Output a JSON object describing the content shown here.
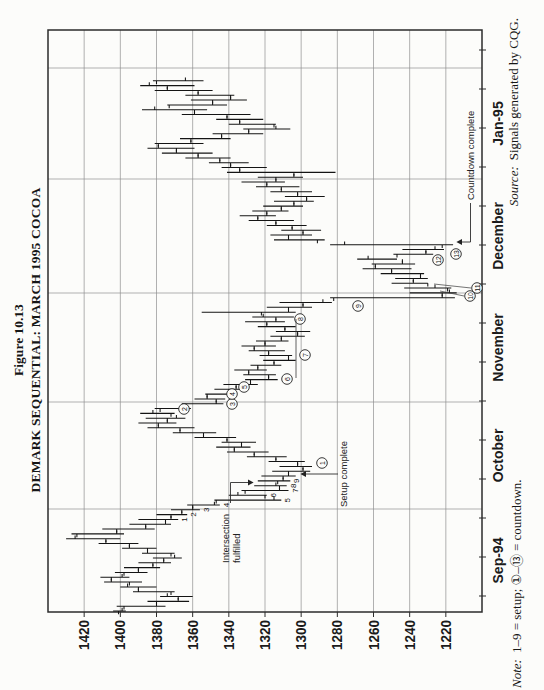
{
  "figure": {
    "label": "Figure 10.13",
    "title": "DEMARK SEQUENTIAL: MARCH 1995 COCOA"
  },
  "note": {
    "prefix": "Note:",
    "body": "1–9 = setup; ①–⑬ = countdown."
  },
  "source": {
    "prefix": "Source:",
    "body": "Signals generated by CQG."
  },
  "annotations": {
    "intersection_line1": "Intersection",
    "intersection_line2": "fulfilled",
    "setup_complete": "Setup complete",
    "countdown_complete": "Countdown complete"
  },
  "chart_data": {
    "type": "ohlc-bar",
    "title": "DEMARK SEQUENTIAL: MARCH 1995 COCOA",
    "ylabel": "price",
    "xlabel": "date",
    "grid": true,
    "y_axis": {
      "min": 1200,
      "max": 1440,
      "grid_step": 20,
      "labels": [
        "1420",
        "1400",
        "1380",
        "1360",
        "1340",
        "1320",
        "1300",
        "1280",
        "1260",
        "1240",
        "1220"
      ]
    },
    "x_axis": {
      "months": [
        "Sep-94",
        "October",
        "November",
        "December",
        "Jan-95"
      ]
    },
    "bars_format": [
      "high",
      "low",
      "open",
      "close"
    ],
    "bars": [
      [
        1404,
        1397,
        1401,
        1399
      ],
      [
        1402,
        1375,
        1398,
        1380
      ],
      [
        1385,
        1362,
        1380,
        1368
      ],
      [
        1378,
        1360,
        1368,
        1374
      ],
      [
        1393,
        1370,
        1372,
        1390
      ],
      [
        1400,
        1380,
        1390,
        1396
      ],
      [
        1409,
        1388,
        1395,
        1405
      ],
      [
        1411,
        1395,
        1405,
        1399
      ],
      [
        1403,
        1385,
        1398,
        1390
      ],
      [
        1398,
        1378,
        1390,
        1382
      ],
      [
        1390,
        1372,
        1382,
        1376
      ],
      [
        1382,
        1366,
        1376,
        1370
      ],
      [
        1388,
        1370,
        1372,
        1385
      ],
      [
        1399,
        1380,
        1385,
        1395
      ],
      [
        1412,
        1390,
        1395,
        1408
      ],
      [
        1430,
        1400,
        1408,
        1425
      ],
      [
        1427,
        1398,
        1424,
        1402
      ],
      [
        1410,
        1381,
        1402,
        1386
      ],
      [
        1395,
        1372,
        1386,
        1375
      ],
      [
        1390,
        1368,
        1375,
        1372
      ],
      [
        1380,
        1363,
        1372,
        1366
      ],
      [
        1372,
        1356,
        1366,
        1360
      ],
      [
        1363,
        1345,
        1360,
        1348
      ],
      [
        1348,
        1311,
        1347,
        1315
      ],
      [
        1340,
        1319,
        1320,
        1335
      ],
      [
        1333,
        1307,
        1331,
        1312
      ],
      [
        1326,
        1308,
        1312,
        1314
      ],
      [
        1324,
        1306,
        1313,
        1310
      ],
      [
        1322,
        1303,
        1310,
        1307
      ],
      [
        1316,
        1295,
        1307,
        1299
      ],
      [
        1312,
        1294,
        1299,
        1302
      ],
      [
        1318,
        1298,
        1302,
        1314
      ],
      [
        1330,
        1308,
        1314,
        1326
      ],
      [
        1341,
        1318,
        1326,
        1337
      ],
      [
        1347,
        1328,
        1337,
        1333
      ],
      [
        1344,
        1325,
        1333,
        1341
      ],
      [
        1359,
        1336,
        1341,
        1354
      ],
      [
        1371,
        1347,
        1354,
        1367
      ],
      [
        1385,
        1359,
        1367,
        1379
      ],
      [
        1390,
        1369,
        1379,
        1374
      ],
      [
        1386,
        1364,
        1374,
        1369
      ],
      [
        1389,
        1370,
        1372,
        1382
      ],
      [
        1381,
        1361,
        1378,
        1364
      ],
      [
        1366,
        1343,
        1364,
        1347
      ],
      [
        1359,
        1342,
        1347,
        1352
      ],
      [
        1353,
        1336,
        1352,
        1340
      ],
      [
        1348,
        1330,
        1340,
        1336
      ],
      [
        1343,
        1324,
        1336,
        1328
      ],
      [
        1331,
        1313,
        1328,
        1318
      ],
      [
        1332,
        1314,
        1318,
        1329
      ],
      [
        1337,
        1319,
        1329,
        1324
      ],
      [
        1328,
        1311,
        1324,
        1315
      ],
      [
        1321,
        1303,
        1315,
        1307
      ],
      [
        1323,
        1305,
        1307,
        1318
      ],
      [
        1329,
        1309,
        1318,
        1326
      ],
      [
        1333,
        1314,
        1326,
        1320
      ],
      [
        1325,
        1307,
        1320,
        1311
      ],
      [
        1317,
        1298,
        1311,
        1302
      ],
      [
        1314,
        1295,
        1302,
        1309
      ],
      [
        1324,
        1303,
        1309,
        1319
      ],
      [
        1331,
        1309,
        1319,
        1314
      ],
      [
        1327,
        1304,
        1314,
        1321
      ],
      [
        1355,
        1303,
        1322,
        1307
      ],
      [
        1319,
        1294,
        1307,
        1299
      ],
      [
        1312,
        1283,
        1299,
        1288
      ],
      [
        1284,
        1215,
        1282,
        1222
      ],
      [
        1240,
        1214,
        1222,
        1218
      ],
      [
        1243,
        1217,
        1219,
        1226
      ],
      [
        1250,
        1230,
        1230,
        1238
      ],
      [
        1248,
        1230,
        1238,
        1234
      ],
      [
        1256,
        1232,
        1234,
        1250
      ],
      [
        1266,
        1239,
        1250,
        1259
      ],
      [
        1261,
        1237,
        1259,
        1244
      ],
      [
        1269,
        1247,
        1244,
        1263
      ],
      [
        1249,
        1227,
        1247,
        1231
      ],
      [
        1244,
        1221,
        1231,
        1226
      ],
      [
        1284,
        1216,
        1222,
        1276
      ],
      [
        1315,
        1287,
        1291,
        1307
      ],
      [
        1317,
        1294,
        1307,
        1299
      ],
      [
        1311,
        1289,
        1299,
        1305
      ],
      [
        1319,
        1297,
        1305,
        1314
      ],
      [
        1329,
        1304,
        1314,
        1324
      ],
      [
        1334,
        1314,
        1324,
        1319
      ],
      [
        1327,
        1307,
        1319,
        1311
      ],
      [
        1321,
        1299,
        1311,
        1304
      ],
      [
        1315,
        1293,
        1304,
        1297
      ],
      [
        1309,
        1287,
        1297,
        1302
      ],
      [
        1317,
        1294,
        1302,
        1311
      ],
      [
        1325,
        1301,
        1311,
        1319
      ],
      [
        1333,
        1309,
        1319,
        1314
      ],
      [
        1324,
        1299,
        1314,
        1304
      ],
      [
        1341,
        1281,
        1304,
        1334
      ],
      [
        1344,
        1319,
        1334,
        1339
      ],
      [
        1351,
        1329,
        1339,
        1345
      ],
      [
        1364,
        1339,
        1345,
        1357
      ],
      [
        1377,
        1349,
        1357,
        1369
      ],
      [
        1385,
        1359,
        1369,
        1379
      ],
      [
        1381,
        1354,
        1379,
        1361
      ],
      [
        1367,
        1339,
        1361,
        1344
      ],
      [
        1349,
        1321,
        1344,
        1329
      ],
      [
        1332,
        1306,
        1329,
        1314
      ],
      [
        1340,
        1314,
        1315,
        1334
      ],
      [
        1347,
        1321,
        1334,
        1341
      ],
      [
        1366,
        1328,
        1341,
        1359
      ],
      [
        1388,
        1352,
        1359,
        1381
      ],
      [
        1374,
        1341,
        1373,
        1349
      ],
      [
        1361,
        1330,
        1349,
        1339
      ],
      [
        1364,
        1337,
        1339,
        1357
      ],
      [
        1381,
        1349,
        1357,
        1374
      ],
      [
        1389,
        1359,
        1374,
        1384
      ],
      [
        1382,
        1354,
        1380,
        1364
      ]
    ],
    "setup_digits": [
      {
        "bar": 19,
        "digit": "1"
      },
      {
        "bar": 20,
        "digit": "2"
      },
      {
        "bar": 21,
        "digit": "3"
      },
      {
        "bar": 22,
        "digit": "4"
      },
      {
        "bar": 23,
        "digit": "5"
      },
      {
        "bar": 24,
        "digit": "6"
      },
      {
        "bar": 25,
        "digit": "7"
      },
      {
        "bar": 26,
        "digit": "8"
      },
      {
        "bar": 27,
        "digit": "9"
      }
    ],
    "countdown": [
      {
        "n": "1",
        "x": 227,
        "y": 322
      },
      {
        "n": "2",
        "x": 281,
        "y": 184
      },
      {
        "n": "3",
        "x": 286,
        "y": 232
      },
      {
        "n": "4",
        "x": 296,
        "y": 232
      },
      {
        "n": "5",
        "x": 303,
        "y": 244
      },
      {
        "n": "6",
        "x": 311,
        "y": 287
      },
      {
        "n": "7",
        "x": 335,
        "y": 305
      },
      {
        "n": "8",
        "x": 371,
        "y": 300
      },
      {
        "n": "9",
        "x": 384,
        "y": 358
      },
      {
        "n": "10",
        "x": 394,
        "y": 470
      },
      {
        "n": "11",
        "x": 402,
        "y": 477
      },
      {
        "n": "12",
        "x": 430,
        "y": 438
      },
      {
        "n": "13",
        "x": 436,
        "y": 456
      }
    ],
    "connectors": [
      {
        "x1": 394,
        "y1": 464,
        "x2": 399,
        "y2": 440
      },
      {
        "x1": 402,
        "y1": 471,
        "x2": 406,
        "y2": 434
      }
    ],
    "level_line": {
      "x1": 312,
      "x2": 371,
      "y": 296
    }
  }
}
